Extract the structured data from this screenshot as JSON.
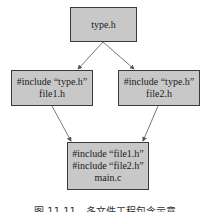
{
  "diagram": {
    "type": "include-dependency-graph",
    "nodes": [
      {
        "id": "type",
        "lines": [
          "type.h"
        ]
      },
      {
        "id": "file1",
        "lines": [
          "#include “type.h”",
          "file1.h"
        ]
      },
      {
        "id": "file2",
        "lines": [
          "#include “type.h”",
          "file2.h"
        ]
      },
      {
        "id": "main",
        "lines": [
          "#include “file1.h”",
          "#include “file2.h”",
          "main.c"
        ]
      }
    ],
    "edges": [
      {
        "from": "type",
        "to": "file1"
      },
      {
        "from": "type",
        "to": "file2"
      },
      {
        "from": "file1",
        "to": "main"
      },
      {
        "from": "file2",
        "to": "main"
      }
    ],
    "colors": {
      "node_fill": "#c8c8c8",
      "node_border": "#3a3a3a",
      "edge": "#555555"
    }
  },
  "caption": "图 11.11　多文件工程包含示意"
}
